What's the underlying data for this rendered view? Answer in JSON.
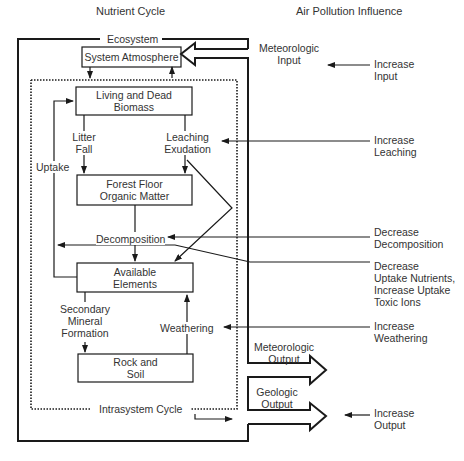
{
  "headers": {
    "left": "Nutrient Cycle",
    "right": "Air Pollution Influence"
  },
  "boundaries": {
    "ecosystem": "Ecosystem",
    "intrasystem": "Intrasystem Cycle"
  },
  "boxes": {
    "atmosphere": "System Atmosphere",
    "biomass": "Living and Dead\nBiomass",
    "forest_floor": "Forest Floor\nOrganic Matter",
    "available": "Available\nElements",
    "rock": "Rock and\nSoil"
  },
  "flows": {
    "litter_fall": "Litter\nFall",
    "leaching": "Leaching\nExudation",
    "uptake": "Uptake",
    "decomposition": "Decomposition",
    "secondary": "Secondary\nMineral\nFormation",
    "weathering": "Weathering"
  },
  "io": {
    "met_input": "Meteorologic\nInput",
    "met_output": "Meteorologic\nOutput",
    "geo_output": "Geologic\nOutput"
  },
  "influences": {
    "input": "Increase\nInput",
    "leaching": "Increase\nLeaching",
    "decomposition": "Decrease\nDecomposition",
    "uptake": "Decrease\nUptake Nutrients,\nIncrease Uptake\nToxic Ions",
    "weathering": "Increase\nWeathering",
    "output": "Increase\nOutput"
  },
  "colors": {
    "line": "#1a1a1a",
    "text": "#333333",
    "background": "#ffffff"
  }
}
